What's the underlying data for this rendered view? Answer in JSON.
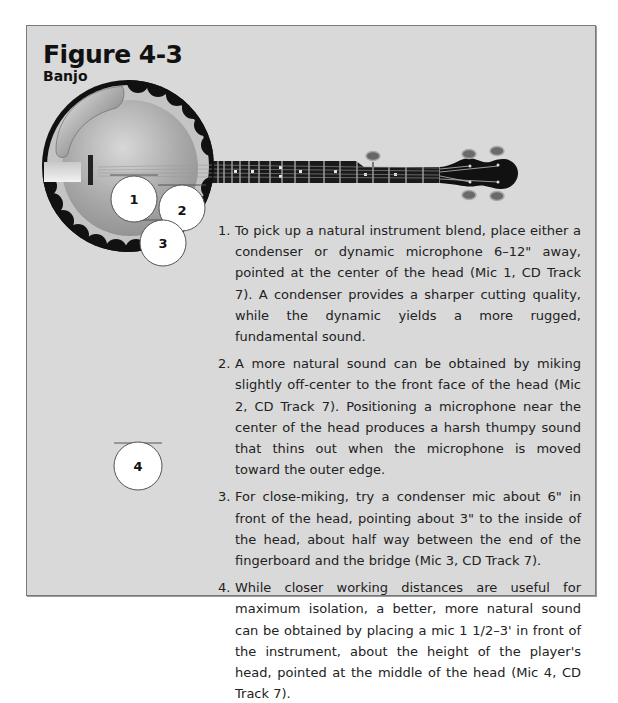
{
  "figure": {
    "title": "Figure 4-3",
    "subtitle": "Banjo"
  },
  "microphones": [
    {
      "id": "1",
      "label": "1"
    },
    {
      "id": "2",
      "label": "2"
    },
    {
      "id": "3",
      "label": "3"
    },
    {
      "id": "4",
      "label": "4"
    }
  ],
  "steps": [
    {
      "num": "1.",
      "text": "To pick up a natural instrument blend, place either a condenser or dynamic microphone 6–12\" away, pointed at the center of the head (Mic 1, CD Track 7). A condenser provides a sharper cutting quality, while the dynamic yields a more rugged, fundamental sound."
    },
    {
      "num": "2.",
      "text": "A more natural sound can be obtained by miking slightly off-center to the front face of the head (Mic 2, CD Track 7). Positioning a microphone near the center of the head produces a harsh thumpy sound that thins out when the microphone is moved toward the outer edge."
    },
    {
      "num": "3.",
      "text": "For close-miking, try a condenser mic about 6\" in front of the head, pointing about 3\" to the inside of the head, about half way between the end of the fingerboard and the bridge (Mic 3, CD Track 7)."
    },
    {
      "num": "4.",
      "text": "While closer working distances are useful for maximum isolation, a better, more natural sound can be obtained by placing a mic 1 1/2–3' in front of the instrument, about the height of the player's head, pointed at the middle of the head (Mic 4, CD Track 7)."
    }
  ],
  "colors": {
    "panel_bg": "#d9d9d9",
    "panel_border": "#7a7a7a",
    "banjo_black": "#111111",
    "mic_fill": "#ffffff"
  }
}
